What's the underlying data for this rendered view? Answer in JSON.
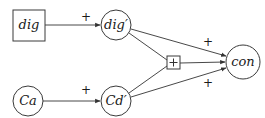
{
  "diagram": {
    "type": "signed causal graph",
    "nodes": [
      {
        "id": "dig",
        "label": "dig",
        "shape": "rect",
        "cx": 29,
        "cy": 25,
        "w": 32,
        "h": 31
      },
      {
        "id": "digp",
        "label": "dig′",
        "shape": "circle",
        "cx": 116,
        "cy": 25,
        "r": 15
      },
      {
        "id": "ca",
        "label": "Ca",
        "shape": "circle",
        "cx": 28,
        "cy": 101,
        "r": 15
      },
      {
        "id": "cdp",
        "label": "Cd′",
        "shape": "circle",
        "cx": 116,
        "cy": 101,
        "r": 15
      },
      {
        "id": "plus",
        "label": "+",
        "shape": "rect",
        "cx": 174,
        "cy": 63,
        "w": 13,
        "h": 13
      },
      {
        "id": "con",
        "label": "con",
        "shape": "circle",
        "cx": 243,
        "cy": 62,
        "r": 17
      }
    ],
    "edges": [
      {
        "from": "dig",
        "to": "digp",
        "label": "+",
        "label_x": 86,
        "label_y": 21
      },
      {
        "from": "ca",
        "to": "cdp",
        "label": "+",
        "label_x": 86,
        "label_y": 94
      },
      {
        "from": "digp",
        "to": "con",
        "label": "+",
        "label_x": 208,
        "label_y": 46
      },
      {
        "from": "cdp",
        "to": "con",
        "label": "+",
        "label_x": 208,
        "label_y": 87
      },
      {
        "from": "digp",
        "to": "plus",
        "label": ""
      },
      {
        "from": "cdp",
        "to": "plus",
        "label": ""
      },
      {
        "from": "plus",
        "to": "con",
        "label": ""
      }
    ],
    "colors": {
      "stroke": "#333333",
      "background": "#ffffff",
      "text": "#1a1a1a"
    }
  }
}
